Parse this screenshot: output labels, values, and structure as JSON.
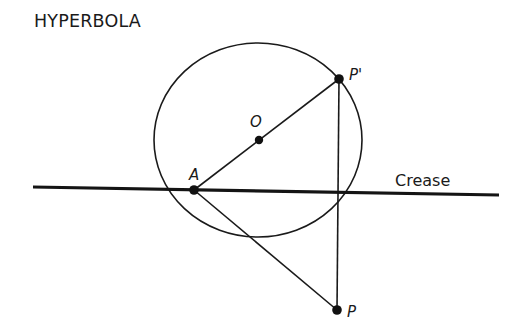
{
  "title": "HYPERBOLA",
  "labels": {
    "center": "O",
    "point_on_circle": "P'",
    "focus_inside": "A",
    "outside_point": "P",
    "crease": "Crease"
  },
  "geometry": {
    "circle": {
      "cx": 258,
      "cy": 140,
      "rx": 104,
      "ry": 97
    },
    "points": {
      "O": {
        "x": 259,
        "y": 140
      },
      "A": {
        "x": 194,
        "y": 190
      },
      "P_prime": {
        "x": 339,
        "y": 79
      },
      "P": {
        "x": 337,
        "y": 310
      }
    },
    "crease_line": {
      "x1": 33,
      "y1": 187,
      "x2": 499,
      "y2": 195
    }
  },
  "colors": {
    "ink": "#1a1a1a",
    "background": "#ffffff"
  }
}
